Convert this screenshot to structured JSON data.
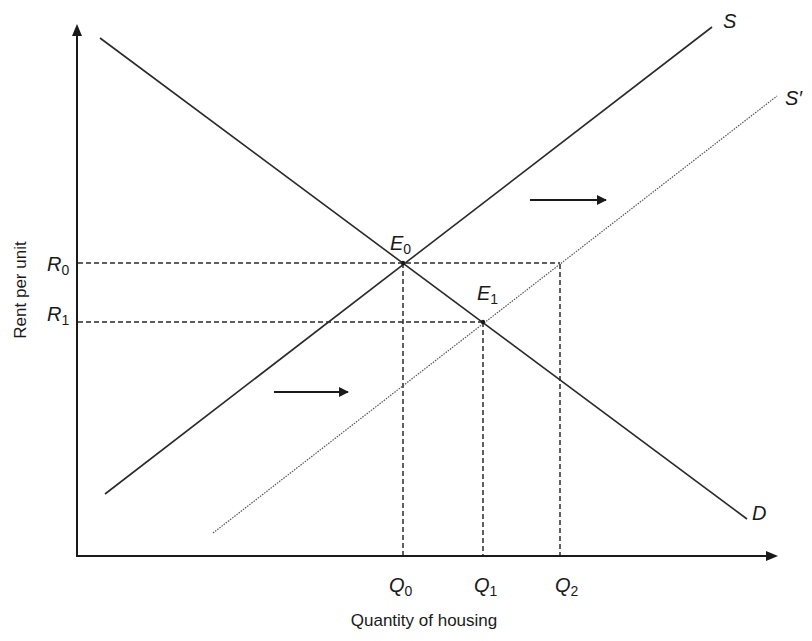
{
  "diagram": {
    "title": "",
    "y_axis_label": "Rent per unit",
    "x_axis_label": "Quantity of housing",
    "curves": {
      "demand": {
        "label": "D",
        "style": "solid"
      },
      "supply": {
        "label": "S",
        "style": "solid"
      },
      "supply_shifted": {
        "label": "S′",
        "style": "dotted"
      }
    },
    "equilibria": [
      {
        "id": "E0",
        "letter": "E",
        "sub": "0"
      },
      {
        "id": "E1",
        "letter": "E",
        "sub": "1"
      }
    ],
    "price_levels": [
      {
        "id": "R0",
        "letter": "R",
        "sub": "0"
      },
      {
        "id": "R1",
        "letter": "R",
        "sub": "1"
      }
    ],
    "quantity_levels": [
      {
        "id": "Q0",
        "letter": "Q",
        "sub": "0"
      },
      {
        "id": "Q1",
        "letter": "Q",
        "sub": "1"
      },
      {
        "id": "Q2",
        "letter": "Q",
        "sub": "2"
      }
    ],
    "annotations": [
      {
        "type": "arrow",
        "direction": "right",
        "meaning": "supply shifts right (upper)"
      },
      {
        "type": "arrow",
        "direction": "right",
        "meaning": "supply shifts right (lower)"
      }
    ],
    "colors": {
      "line": "#2a2a2a",
      "dashed": "#2a2a2a",
      "background": "#ffffff"
    }
  }
}
